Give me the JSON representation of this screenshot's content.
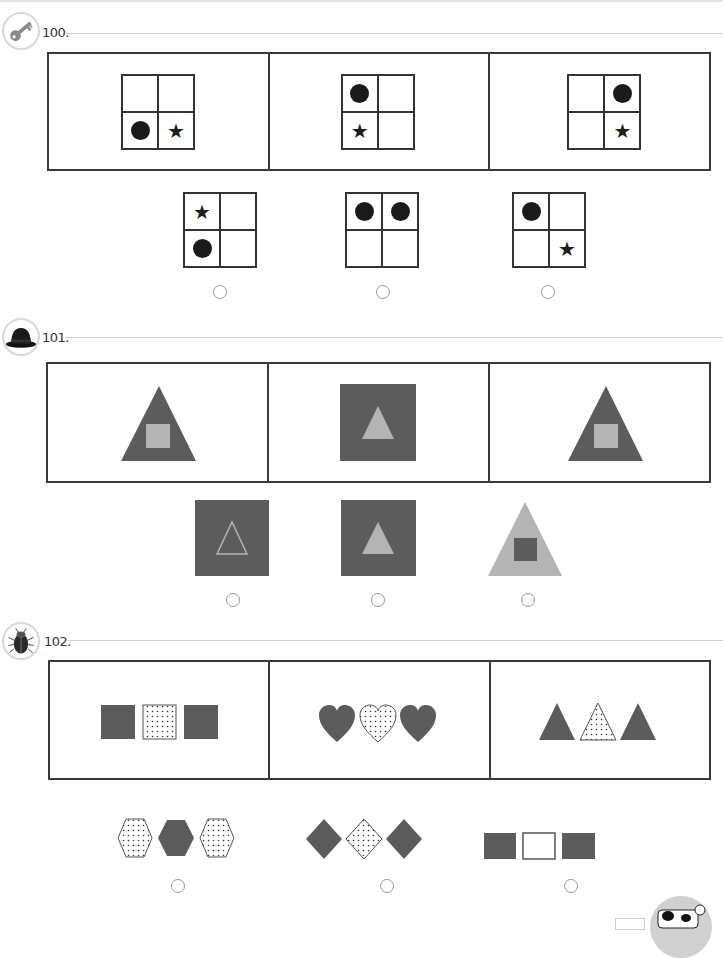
{
  "page": {
    "colors": {
      "dark_fill": "#5c5c5c",
      "light_fill": "#b4b4b4",
      "line": "#3a3a3a",
      "radio": "#9a9a9a"
    }
  },
  "questions": [
    {
      "number": "100.",
      "icon": "key-icon",
      "stem": [
        {
          "cells": [
            "",
            "",
            "dot",
            "star"
          ]
        },
        {
          "cells": [
            "dot",
            "",
            "star",
            ""
          ]
        },
        {
          "cells": [
            "",
            "dot",
            "",
            "star"
          ]
        }
      ],
      "options": [
        {
          "cells": [
            "star",
            "",
            "dot",
            ""
          ]
        },
        {
          "cells": [
            "dot",
            "dot",
            "",
            ""
          ]
        },
        {
          "cells": [
            "dot",
            "",
            "",
            "star"
          ]
        }
      ]
    },
    {
      "number": "101.",
      "icon": "bowler-hat-icon",
      "stem": [
        {
          "shape": "dark triangle with light square inside"
        },
        {
          "shape": "dark square with light triangle inside"
        },
        {
          "shape": "dark triangle with light square inside"
        }
      ],
      "options": [
        {
          "shape": "dark square with outlined triangle inside"
        },
        {
          "shape": "dark square with light triangle inside"
        },
        {
          "shape": "light triangle with dark square inside"
        }
      ]
    },
    {
      "number": "102.",
      "icon": "beetle-icon",
      "stem": [
        {
          "shape": "squares: dark, dotted, dark"
        },
        {
          "shape": "hearts: dark, dotted, dark"
        },
        {
          "shape": "triangles: dark, dotted, dark"
        }
      ],
      "options": [
        {
          "shape": "hexagons: dotted, dark, dotted"
        },
        {
          "shape": "diamonds: dark, dotted, dark"
        },
        {
          "shape": "rectangles: dark, white, dark"
        }
      ]
    }
  ],
  "symbols": {
    "star": "★"
  },
  "footer": {
    "mascot": "cow-icon"
  }
}
